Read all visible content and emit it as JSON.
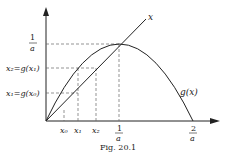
{
  "figure": {
    "caption": "Fig. 20.1",
    "curve_label": "g(x)",
    "line_label": "x",
    "y_labels": {
      "top_num": "1",
      "top_den": "a",
      "x2": "x₂=g(x₁)",
      "x1": "x₁=g(x₀)"
    },
    "x_labels": {
      "x0": "x₀",
      "x1": "x₁",
      "x2": "x₂",
      "one_over_a_num": "1",
      "one_over_a_den": "a",
      "two_over_a_num": "2",
      "two_over_a_den": "a"
    }
  },
  "colors": {
    "ink": "#222222",
    "dash": "#666666",
    "background": "#ffffff"
  }
}
